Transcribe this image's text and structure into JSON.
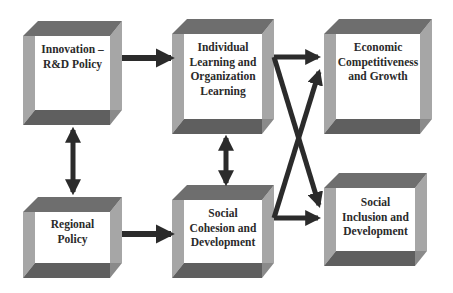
{
  "diagram": {
    "colors": {
      "background": "#ffffff",
      "bevel_top": "#6e6e6e",
      "bevel_bottom": "#5f5f5f",
      "bevel_side": "#a6a6a6",
      "face": "#ffffff",
      "arrow": "#2b2b2b",
      "text": "#2a2a2a"
    },
    "boxes": [
      {
        "id": "innovation",
        "label": "Innovation –\nR&D Policy"
      },
      {
        "id": "individual-learning",
        "label": "Individual\nLearning and\nOrganization\nLearning"
      },
      {
        "id": "economic-competitiveness",
        "label": "Economic\nCompetitiveness\nand Growth"
      },
      {
        "id": "regional-policy",
        "label": "Regional\nPolicy"
      },
      {
        "id": "social-cohesion",
        "label": "Social\nCohesion and\nDevelopment"
      },
      {
        "id": "social-inclusion",
        "label": "Social\nInclusion and\nDevelopment"
      }
    ],
    "edges": [
      {
        "from": "innovation",
        "to": "individual-learning",
        "type": "one-way"
      },
      {
        "from": "innovation",
        "to": "regional-policy",
        "type": "two-way"
      },
      {
        "from": "individual-learning",
        "to": "social-cohesion",
        "type": "two-way"
      },
      {
        "from": "regional-policy",
        "to": "social-cohesion",
        "type": "one-way"
      },
      {
        "from": "individual-learning",
        "to": "economic-competitiveness",
        "type": "one-way"
      },
      {
        "from": "individual-learning",
        "to": "social-inclusion",
        "type": "one-way"
      },
      {
        "from": "social-cohesion",
        "to": "economic-competitiveness",
        "type": "one-way"
      },
      {
        "from": "social-cohesion",
        "to": "social-inclusion",
        "type": "one-way"
      }
    ]
  }
}
